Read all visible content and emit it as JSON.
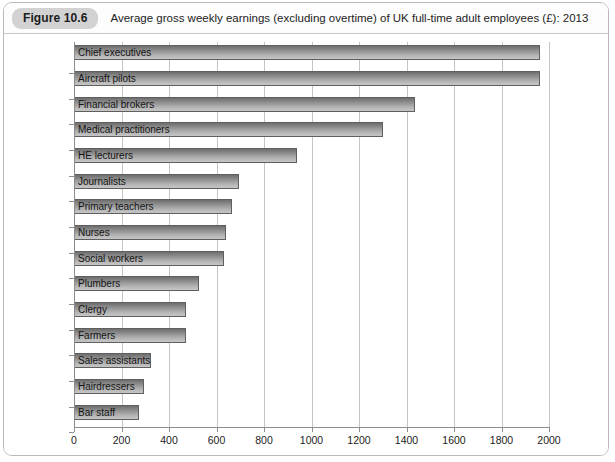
{
  "figure": {
    "badge": "Figure 10.6",
    "caption": "Average gross weekly earnings (excluding overtime) of UK full-time adult employees (£): 2013"
  },
  "chart_data": {
    "type": "bar",
    "orientation": "horizontal",
    "title": "Average gross weekly earnings (excluding overtime) of UK full-time adult employees (£): 2013",
    "xlabel": "",
    "ylabel": "",
    "xlim": [
      0,
      2000
    ],
    "xticks": [
      0,
      200,
      400,
      600,
      800,
      1000,
      1200,
      1400,
      1600,
      1800,
      2000
    ],
    "grid": true,
    "legend": "none",
    "categories": [
      "Chief executives",
      "Aircraft pilots",
      "Financial brokers",
      "Medical practitioners",
      "HE lecturers",
      "Journalists",
      "Primary teachers",
      "Nurses",
      "Social workers",
      "Plumbers",
      "Clergy",
      "Farmers",
      "Sales assistants",
      "Hairdressers",
      "Bar staff"
    ],
    "values": [
      1960,
      1960,
      1435,
      1300,
      940,
      695,
      665,
      640,
      630,
      525,
      470,
      470,
      325,
      295,
      275
    ],
    "bar_color": "#8f8f8f"
  }
}
